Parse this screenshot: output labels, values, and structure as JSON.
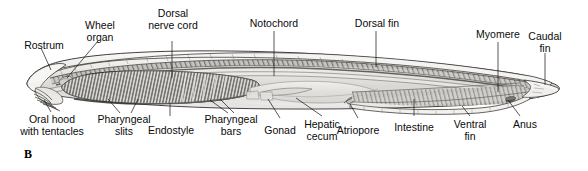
{
  "figure": {
    "panel_letter": "B",
    "palette": {
      "ink": "#111111",
      "body_light": "#f2f1ef",
      "body_mid": "#c9c7c4",
      "body_dark": "#8e8c89",
      "shadow": "#6b6967",
      "background": "#ffffff"
    }
  },
  "labels": {
    "rostrum": "Rostrum",
    "wheel_organ": "Wheel\norgan",
    "dorsal_nerve_cord": "Dorsal\nnerve cord",
    "notochord": "Notochord",
    "dorsal_fin": "Dorsal fin",
    "myomere": "Myomere",
    "caudal_fin": "Caudal\nfin",
    "oral_hood": "Oral hood\nwith tentacles",
    "pharyngeal_slits": "Pharyngeal\nslits",
    "endostyle": "Endostyle",
    "pharyngeal_bars": "Pharyngeal\nbars",
    "gonad": "Gonad",
    "hepatic_cecum": "Hepatic\ncecum",
    "atriopore": "Atriopore",
    "intestine": "Intestine",
    "ventral_fin": "Ventral\nfin",
    "anus": "Anus"
  }
}
